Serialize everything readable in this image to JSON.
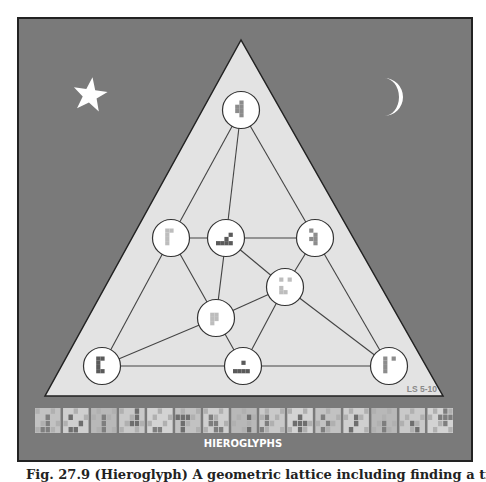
{
  "puzzle": {
    "title": "HIEROGLYPHS",
    "code_label": "LS 5-10",
    "colors": {
      "background": "#7a7a7a",
      "frame_border": "#222222",
      "triangle_fill": "#e3e3e3",
      "triangle_stroke": "#222222",
      "node_fill": "#ffffff",
      "node_stroke": "#333333",
      "edge": "#444444",
      "glyph_dark": "#5a5a5a",
      "glyph_mid": "#8c8c8c",
      "glyph_light": "#bdbdbd",
      "sky_symbol": "#ffffff",
      "strip_tile": "#c9c9c9"
    },
    "sky_symbols": [
      {
        "name": "star",
        "x": 90,
        "y": 95
      },
      {
        "name": "crescent-moon",
        "x": 392,
        "y": 96
      }
    ],
    "triangle": {
      "apex": [
        241,
        40
      ],
      "base_left": [
        45,
        396
      ],
      "base_right": [
        443,
        396
      ]
    },
    "nodes": [
      {
        "id": "n1",
        "x": 241,
        "y": 110,
        "glyph": "vertical-with-left-notch",
        "shade": "mid"
      },
      {
        "id": "n2",
        "x": 171,
        "y": 238,
        "glyph": "gamma-tall",
        "shade": "light"
      },
      {
        "id": "n3",
        "x": 226,
        "y": 238,
        "glyph": "stair-step",
        "shade": "dark"
      },
      {
        "id": "n4",
        "x": 315,
        "y": 238,
        "glyph": "zigzag-column",
        "shade": "mid"
      },
      {
        "id": "n5",
        "x": 285,
        "y": 287,
        "glyph": "two-dots-and-L",
        "shade": "light"
      },
      {
        "id": "n6",
        "x": 216,
        "y": 318,
        "glyph": "P-shape",
        "shade": "light"
      },
      {
        "id": "n7",
        "x": 102,
        "y": 366,
        "glyph": "C-block",
        "shade": "dark"
      },
      {
        "id": "n8",
        "x": 243,
        "y": 366,
        "glyph": "dot-over-bar",
        "shade": "dark"
      },
      {
        "id": "n9",
        "x": 389,
        "y": 366,
        "glyph": "bar-with-dot",
        "shade": "mid"
      }
    ],
    "edges": [
      [
        "n1",
        "n2"
      ],
      [
        "n1",
        "n3"
      ],
      [
        "n1",
        "n4"
      ],
      [
        "n2",
        "n3"
      ],
      [
        "n3",
        "n4"
      ],
      [
        "n2",
        "n6"
      ],
      [
        "n2",
        "n7"
      ],
      [
        "n3",
        "n6"
      ],
      [
        "n3",
        "n5"
      ],
      [
        "n4",
        "n5"
      ],
      [
        "n4",
        "n9"
      ],
      [
        "n5",
        "n6"
      ],
      [
        "n5",
        "n8"
      ],
      [
        "n5",
        "n9"
      ],
      [
        "n6",
        "n7"
      ],
      [
        "n6",
        "n8"
      ],
      [
        "n7",
        "n8"
      ],
      [
        "n8",
        "n9"
      ]
    ],
    "strip_tile_count": 15
  },
  "caption": "Fig. 27.9   (Hieroglyph) A geometric lattice including finding a triad"
}
